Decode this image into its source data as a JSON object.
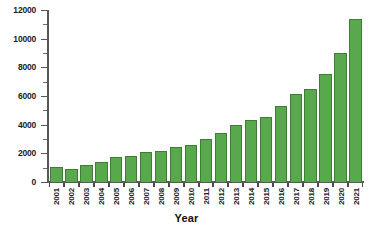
{
  "chart_data": {
    "type": "bar",
    "title": "",
    "xlabel": "Year",
    "ylabel": "",
    "categories": [
      "2001",
      "2002",
      "2003",
      "2004",
      "2005",
      "2006",
      "2007",
      "2008",
      "2009",
      "2010",
      "2011",
      "2012",
      "2013",
      "2014",
      "2015",
      "2016",
      "2017",
      "2018",
      "2019",
      "2020",
      "2021"
    ],
    "values": [
      1020,
      930,
      1180,
      1390,
      1780,
      1790,
      2090,
      2180,
      2460,
      2580,
      3020,
      3400,
      4010,
      4350,
      4560,
      5300,
      6150,
      6500,
      7540,
      9020,
      11400
    ],
    "ylim": [
      0,
      12000
    ],
    "ytick_values": [
      0,
      2000,
      4000,
      6000,
      8000,
      10000,
      12000
    ],
    "ytick_labels": [
      "0",
      "2000",
      "4000",
      "6000",
      "8000",
      "10000",
      "12000"
    ],
    "yminor_interval": 1000,
    "grid": false,
    "legend": false,
    "series_color": "#5aa84e",
    "series_edge_color": "#3f7d37",
    "axis_color": "#585858",
    "text_color": "#1c1c1c"
  }
}
